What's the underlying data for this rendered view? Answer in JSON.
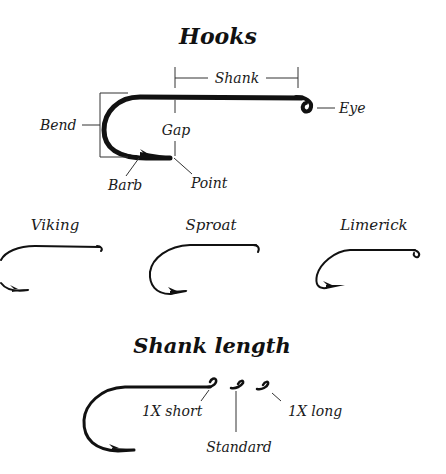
{
  "diagram": {
    "title": "Hooks",
    "anatomy": {
      "labels": {
        "shank": "Shank",
        "eye": "Eye",
        "bend": "Bend",
        "gap": "Gap",
        "barb": "Barb",
        "point": "Point"
      }
    },
    "hook_styles": [
      {
        "name": "Viking"
      },
      {
        "name": "Sproat"
      },
      {
        "name": "Limerick"
      }
    ],
    "shank_length": {
      "title": "Shank length",
      "variants": [
        {
          "label": "1X short"
        },
        {
          "label": "Standard"
        },
        {
          "label": "1X long"
        }
      ]
    },
    "colors": {
      "ink": "#111111",
      "background": "#ffffff"
    }
  }
}
